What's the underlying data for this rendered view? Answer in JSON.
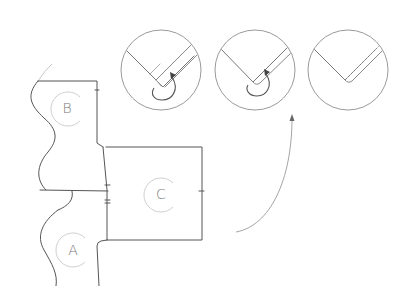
{
  "diagram": {
    "type": "assembly-instruction",
    "parts": [
      {
        "id": "B",
        "label": "B",
        "cx": 67,
        "cy": 108
      },
      {
        "id": "C",
        "label": "C",
        "cx": 160,
        "cy": 194
      },
      {
        "id": "A",
        "label": "A",
        "cx": 72,
        "cy": 250
      }
    ],
    "detail_steps": [
      {
        "step": 1,
        "cx": 161,
        "cy": 70,
        "r": 40,
        "description": "corner with tape/strip, rotate arrow"
      },
      {
        "step": 2,
        "cx": 255,
        "cy": 70,
        "r": 40,
        "description": "corner with strip, rotate arrow"
      },
      {
        "step": 3,
        "cx": 348,
        "cy": 70,
        "r": 40,
        "description": "strip applied to corner edge"
      }
    ],
    "colors": {
      "line": "#555555",
      "light_line": "#b8b8b8",
      "label_ring": "#cfcfcf",
      "label_text": "#7a7a7a"
    }
  }
}
